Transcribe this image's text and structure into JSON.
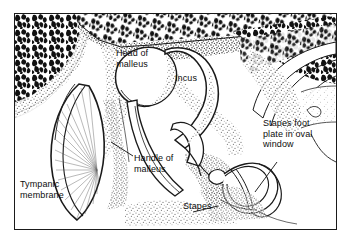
{
  "figure": {
    "border_color": "#1a1a1a",
    "background_color": "#ffffff",
    "ink_color": "#0d0d0d"
  },
  "labels": [
    {
      "id": "head-of-malleus",
      "text": "Head of\nmalleus",
      "x": 104,
      "y": 47,
      "leader": false
    },
    {
      "id": "incus",
      "text": "Incus",
      "x": 174,
      "y": 72,
      "leader": false
    },
    {
      "id": "stapes-footplate",
      "text": "Stapes foot\nplate in oval\nwindow",
      "x": 262,
      "y": 117,
      "leader": true
    },
    {
      "id": "handle-of-malleus",
      "text": "Handle of\nmalleus",
      "x": 133,
      "y": 152,
      "leader": true
    },
    {
      "id": "tympanic-membrane",
      "text": "Tympanic\nmembrane",
      "x": 19,
      "y": 178,
      "leader": false
    },
    {
      "id": "stapes",
      "text": "Stapes",
      "x": 182,
      "y": 200,
      "leader": true
    }
  ],
  "structures": [
    {
      "id": "cancellous-bone-left",
      "name": "Cancellous bone, left wall"
    },
    {
      "id": "cancellous-bone-top",
      "name": "Cancellous bone, roof (tegmen tympani)"
    },
    {
      "id": "cancellous-bone-right",
      "name": "Cancellous bone, right wall"
    },
    {
      "id": "tympanic-membrane-drum",
      "name": "Tympanic membrane with radiating fibres"
    },
    {
      "id": "malleus-head",
      "name": "Head of malleus"
    },
    {
      "id": "malleus-handle",
      "name": "Handle of malleus (manubrium)"
    },
    {
      "id": "incus-body",
      "name": "Incus body and long process"
    },
    {
      "id": "stapes-bone",
      "name": "Stapes (stirrup) with crura and footplate"
    },
    {
      "id": "oval-window",
      "name": "Oval window niche"
    }
  ]
}
